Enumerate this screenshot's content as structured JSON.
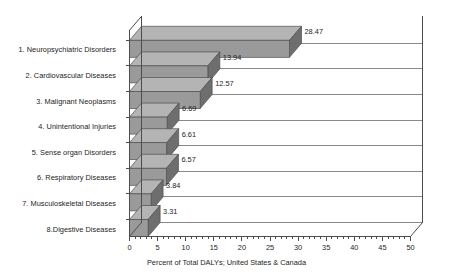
{
  "chart_data": {
    "type": "bar",
    "orientation": "horizontal",
    "style": "3d",
    "title": "",
    "xlabel": "Percent of Total DALYs; United States & Canada",
    "ylabel": "",
    "xlim": [
      0,
      50
    ],
    "xticks": [
      0,
      5,
      10,
      15,
      20,
      25,
      30,
      35,
      40,
      45,
      50
    ],
    "xtick_labels": [
      "0",
      "5",
      "10",
      "15",
      "20",
      "25",
      "30",
      "35",
      "40",
      "45",
      "50"
    ],
    "minor_tick_step": 1,
    "grid": "horizontal",
    "legend": "none",
    "categories": [
      "1. Neuropsychiatric Disorders",
      "2. Cardiovascular Diseases",
      "3. Malignant Neoplasms",
      "4. Unintentional Injuries",
      "5. Sense organ Disorders",
      "6. Respiratory Diseases",
      "7. Musculoskeletal Diseases",
      "8.Digestive Diseases"
    ],
    "values": [
      28.47,
      13.94,
      12.57,
      6.69,
      6.61,
      6.57,
      3.84,
      3.31
    ],
    "value_labels": [
      "28.47",
      "13.94",
      "12.57",
      "6.69",
      "6.61",
      "6.57",
      "3.84",
      "3.31"
    ],
    "colors": {
      "bar_front": "#9a9a9a",
      "bar_top": "#b4b4b4",
      "bar_side": "#6e6e6e",
      "axis": "#4d4d4d",
      "grid": "#8a8a8a",
      "text": "#1d1d1d",
      "background": "#ffffff"
    }
  }
}
